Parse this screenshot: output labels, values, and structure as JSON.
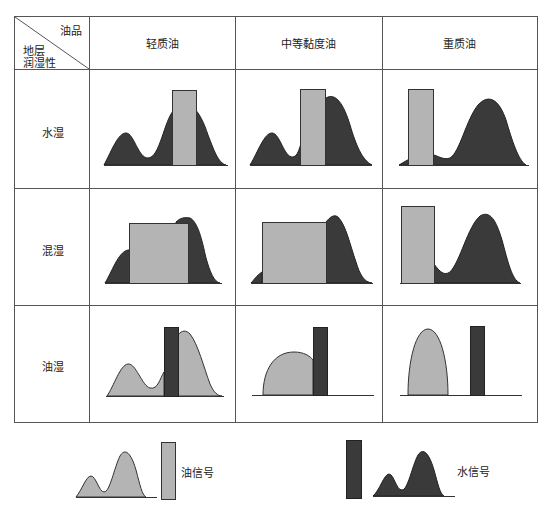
{
  "table": {
    "corner": {
      "top_right_label": "油品",
      "bottom_left_line1": "地层",
      "bottom_left_line2": "润湿性"
    },
    "columns": [
      "轻质油",
      "中等黏度油",
      "重质油"
    ],
    "rows": [
      "水湿",
      "混湿",
      "油湿"
    ]
  },
  "legend": {
    "oil_signal_label": "油信号",
    "water_signal_label": "水信号"
  },
  "colors": {
    "oil_fill": "#b4b4b4",
    "water_fill": "#3a3a3a",
    "line": "#333333",
    "grid": "#555555"
  }
}
